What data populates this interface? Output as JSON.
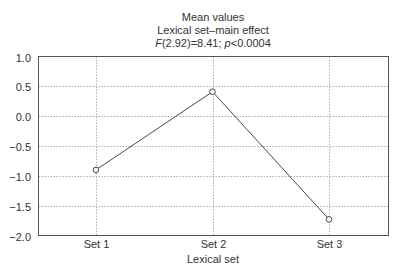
{
  "chart_data": {
    "type": "line",
    "title": "Mean values",
    "subtitle": "Lexical set–main effect",
    "annotation": {
      "stat_label": "F",
      "df": "(2.92)",
      "f_value": "=8.41;",
      "p_label": "p",
      "p_text": "<0.0004"
    },
    "xlabel": "Lexical set",
    "ylabel": "",
    "categories": [
      "Set 1",
      "Set 2",
      "Set 3"
    ],
    "series": [
      {
        "name": "Mean values",
        "values": [
          -0.9,
          0.41,
          -1.73
        ]
      }
    ],
    "ylim": [
      -2.0,
      1.0
    ],
    "yticks": [
      1.0,
      0.5,
      0.0,
      -0.5,
      -1.0,
      -1.5,
      -2.0
    ],
    "ytick_labels": [
      "1.0",
      "0.5",
      "0.0",
      "−0.5",
      "−1.0",
      "−1.5",
      "−2.0"
    ],
    "grid": true,
    "legend": "none",
    "marker": "open-circle"
  }
}
